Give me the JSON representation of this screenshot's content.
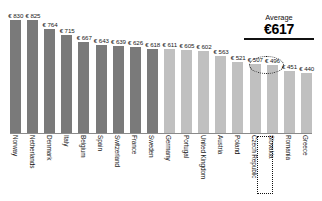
{
  "chart_data": {
    "type": "bar",
    "title": "",
    "xlabel": "",
    "ylabel": "",
    "ylim": [
      0,
      900
    ],
    "grid": false,
    "legend": "none",
    "currency_symbol": "€",
    "categories": [
      "Norway",
      "Netherlands",
      "Denmark",
      "Italy",
      "Belgium",
      "Spain",
      "Switzerland",
      "France",
      "Sweden",
      "Germany",
      "Portugal",
      "United Kingdom",
      "Austria",
      "Poland",
      "Czech Republic",
      "Slovakia",
      "Romania",
      "Greece"
    ],
    "values": [
      830,
      825,
      764,
      715,
      667,
      643,
      639,
      626,
      618,
      611,
      605,
      602,
      563,
      521,
      507,
      496,
      451,
      440
    ],
    "value_labels": [
      "€ 830",
      "€ 825",
      "€ 764",
      "€ 715",
      "€ 667",
      "€ 643",
      "€ 639",
      "€ 626",
      "€ 618",
      "€ 611",
      "€ 605",
      "€ 602",
      "€ 563",
      "€ 521",
      "€ 507",
      "€ 496",
      "€ 451",
      "€ 440"
    ],
    "bar_styles": [
      "dark",
      "dark",
      "dark",
      "dark",
      "dark",
      "dark",
      "dark",
      "dark",
      "dark",
      "light",
      "light",
      "light",
      "light",
      "light",
      "light",
      "light",
      "light",
      "light"
    ],
    "colors": {
      "above_average": "#7a7a7a",
      "below_average": "#c0c0c0",
      "axis": "#8a8a8a",
      "text": "#1a1a1a",
      "highlight": "#111111"
    },
    "annotations": {
      "average_label": "Average",
      "average_value": "€617",
      "average": 617,
      "highlighted_category": "Slovakia",
      "highlighted_value_label": "€ 496"
    }
  }
}
